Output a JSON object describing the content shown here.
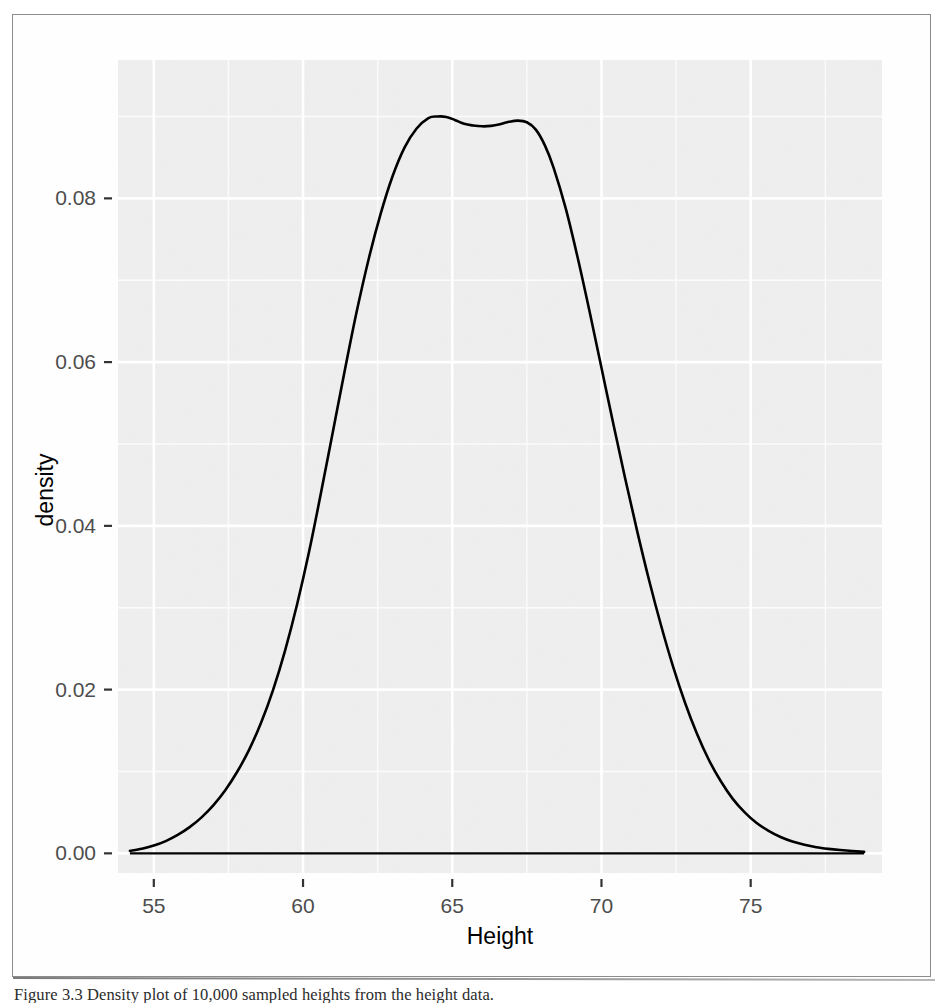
{
  "figure": {
    "caption": "Figure 3.3 Density plot of 10,000 sampled heights from the height data.",
    "frame_color": "#8c8c8c",
    "background": "#ffffff"
  },
  "chart_data": {
    "type": "line",
    "subtype": "density",
    "title": "",
    "subtitle": "",
    "xlabel": "Height",
    "ylabel": "density",
    "xlim": [
      53.8,
      79.4
    ],
    "ylim": [
      -0.0024,
      0.0969
    ],
    "xticks": [
      55,
      60,
      65,
      70,
      75
    ],
    "xtick_labels": [
      "55",
      "60",
      "65",
      "70",
      "75"
    ],
    "yticks": [
      0.0,
      0.02,
      0.04,
      0.06,
      0.08
    ],
    "ytick_labels": [
      "0.00",
      "0.02",
      "0.04",
      "0.06",
      "0.08"
    ],
    "grid": true,
    "grid_major_color": "#ffffff",
    "grid_minor_color": "#fbfbfb",
    "panel_background": "#ebebeb",
    "legend": "none",
    "line_color": "#000000",
    "line_width": 2.6,
    "baseline_at_zero": true,
    "peaks": [
      {
        "x": 64.8,
        "y": 0.09,
        "label": "primary mode"
      },
      {
        "x": 67.2,
        "y": 0.0895,
        "label": "secondary mode"
      }
    ],
    "trough": {
      "x": 66.0,
      "y": 0.0888
    },
    "series": [
      {
        "name": "density",
        "x": [
          54.2,
          54.6,
          55.0,
          55.4,
          55.8,
          56.2,
          56.6,
          57.0,
          57.4,
          57.8,
          58.2,
          58.6,
          59.0,
          59.4,
          59.8,
          60.2,
          60.6,
          61.0,
          61.4,
          61.8,
          62.2,
          62.6,
          63.0,
          63.4,
          63.8,
          64.2,
          64.5,
          64.8,
          65.1,
          65.4,
          65.7,
          66.0,
          66.3,
          66.6,
          66.9,
          67.2,
          67.5,
          67.8,
          68.1,
          68.4,
          68.8,
          69.2,
          69.6,
          70.0,
          70.4,
          70.8,
          71.2,
          71.6,
          72.0,
          72.4,
          72.8,
          73.2,
          73.6,
          74.0,
          74.4,
          74.8,
          75.2,
          75.6,
          76.0,
          76.4,
          76.8,
          77.2,
          77.6,
          78.0,
          78.4,
          78.8
        ],
        "y": [
          0.0003,
          0.00055,
          0.00095,
          0.0015,
          0.00225,
          0.0032,
          0.0044,
          0.0059,
          0.00775,
          0.01,
          0.0127,
          0.016,
          0.02,
          0.0248,
          0.0304,
          0.0368,
          0.044,
          0.0515,
          0.059,
          0.0662,
          0.0726,
          0.0781,
          0.0827,
          0.0862,
          0.0885,
          0.0898,
          0.09,
          0.08995,
          0.08955,
          0.0891,
          0.0889,
          0.0888,
          0.08885,
          0.08905,
          0.08935,
          0.0895,
          0.0893,
          0.0884,
          0.0865,
          0.0837,
          0.0788,
          0.0728,
          0.0662,
          0.0593,
          0.0524,
          0.0457,
          0.0393,
          0.0333,
          0.0278,
          0.0228,
          0.0184,
          0.0146,
          0.0114,
          0.0088,
          0.00665,
          0.005,
          0.0037,
          0.00275,
          0.002,
          0.00145,
          0.00105,
          0.00075,
          0.00055,
          0.0004,
          0.00028,
          0.00018
        ]
      }
    ],
    "n_observations": "10,000"
  },
  "axes": {
    "x_title": "Height",
    "y_title": "density",
    "tick_label_color": "#4d4d4d",
    "axis_title_color": "#000000"
  }
}
